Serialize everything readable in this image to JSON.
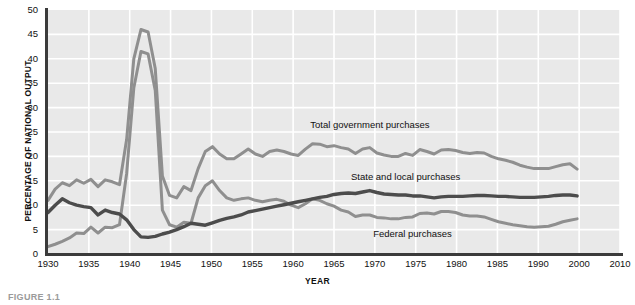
{
  "chart_data": {
    "type": "line",
    "title": "",
    "xlabel": "YEAR",
    "ylabel": "PERCENTAGE OF NATIONAL OUTPUT",
    "xlim": [
      1930,
      2010
    ],
    "ylim": [
      0,
      50
    ],
    "grid": true,
    "legend_position": "inline-annotations",
    "xticks": [
      "1930",
      "1935",
      "1940",
      "1945",
      "1950",
      "1955",
      "1960",
      "1965",
      "1970",
      "1975",
      "1980",
      "1985",
      "1990",
      "2000",
      "2010"
    ],
    "yticks": [
      "0",
      "5",
      "10",
      "15",
      "20",
      "25",
      "30",
      "35",
      "40",
      "45",
      "50"
    ],
    "x": [
      1930,
      1931,
      1932,
      1933,
      1934,
      1935,
      1936,
      1937,
      1938,
      1939,
      1940,
      1941,
      1942,
      1943,
      1944,
      1945,
      1946,
      1947,
      1948,
      1949,
      1950,
      1951,
      1952,
      1953,
      1954,
      1955,
      1956,
      1957,
      1958,
      1959,
      1960,
      1961,
      1962,
      1963,
      1964,
      1965,
      1966,
      1967,
      1968,
      1969,
      1970,
      1971,
      1972,
      1973,
      1974,
      1975,
      1976,
      1977,
      1978,
      1979,
      1980,
      1981,
      1982,
      1983,
      1984,
      1985,
      1986,
      1987,
      1988,
      1989,
      1990,
      1991,
      1992,
      1993,
      1994,
      1995,
      1996,
      1997,
      1998,
      1999,
      2000,
      2001,
      2002,
      2003,
      2004
    ],
    "series": [
      {
        "name": "Total government purchases",
        "color": "#8f8f8f",
        "values": [
          11.0,
          13.3,
          14.6,
          14.0,
          15.2,
          14.5,
          15.3,
          13.8,
          15.2,
          14.8,
          14.2,
          23.5,
          40.0,
          46.0,
          45.5,
          38.0,
          16.0,
          12.0,
          11.5,
          13.8,
          13.0,
          17.5,
          21.0,
          22.0,
          20.5,
          19.5,
          19.5,
          20.5,
          21.5,
          20.5,
          20.0,
          21.0,
          21.3,
          21.0,
          20.5,
          20.2,
          21.5,
          22.6,
          22.5,
          22.0,
          22.2,
          21.8,
          21.5,
          20.6,
          21.5,
          21.8,
          20.7,
          20.3,
          20.0,
          20.0,
          20.6,
          20.2,
          21.4,
          21.0,
          20.5,
          21.3,
          21.4,
          21.2,
          20.8,
          20.6,
          20.8,
          20.7,
          20.0,
          19.5,
          19.2,
          18.8,
          18.2,
          17.8,
          17.5,
          17.5,
          17.5,
          17.9,
          18.3,
          18.5,
          17.4
        ]
      },
      {
        "name": "Federal purchases",
        "color": "#8f8f8f",
        "values": [
          1.5,
          2.0,
          2.6,
          3.3,
          4.3,
          4.2,
          5.5,
          4.3,
          5.5,
          5.4,
          6.0,
          16.5,
          34.0,
          41.5,
          41.0,
          33.5,
          9.0,
          6.0,
          5.5,
          6.5,
          6.3,
          11.5,
          14.0,
          15.0,
          13.0,
          11.5,
          11.0,
          11.3,
          11.5,
          11.0,
          10.7,
          11.0,
          11.2,
          10.8,
          10.0,
          9.5,
          10.3,
          11.3,
          11.0,
          10.3,
          9.8,
          9.0,
          8.6,
          7.7,
          8.0,
          8.0,
          7.5,
          7.4,
          7.2,
          7.2,
          7.5,
          7.6,
          8.3,
          8.4,
          8.2,
          8.7,
          8.7,
          8.5,
          8.0,
          7.8,
          7.8,
          7.6,
          7.1,
          6.6,
          6.3,
          6.0,
          5.8,
          5.6,
          5.5,
          5.6,
          5.7,
          6.1,
          6.6,
          6.9,
          7.2
        ]
      },
      {
        "name": "State and local purchases",
        "color": "#4c4c4c",
        "values": [
          8.5,
          10.0,
          11.3,
          10.5,
          10.0,
          9.7,
          9.5,
          8.0,
          9.0,
          8.5,
          8.2,
          7.0,
          5.0,
          3.5,
          3.4,
          3.6,
          4.1,
          4.5,
          5.0,
          5.6,
          6.3,
          6.1,
          5.9,
          6.4,
          6.9,
          7.3,
          7.6,
          8.0,
          8.6,
          8.9,
          9.2,
          9.5,
          9.8,
          10.1,
          10.4,
          10.7,
          11.0,
          11.3,
          11.6,
          11.8,
          12.2,
          12.4,
          12.5,
          12.4,
          12.7,
          13.0,
          12.6,
          12.3,
          12.2,
          12.1,
          12.1,
          11.9,
          11.9,
          11.7,
          11.5,
          11.7,
          11.8,
          11.8,
          11.8,
          11.9,
          12.0,
          12.0,
          11.9,
          11.8,
          11.8,
          11.7,
          11.6,
          11.6,
          11.6,
          11.7,
          11.8,
          12.0,
          12.1,
          12.1,
          11.9
        ]
      }
    ],
    "annotations": [
      {
        "text": "Total government purchases",
        "x": 1975,
        "y": 26.5
      },
      {
        "text": "State and local purchases",
        "x": 1980,
        "y": 15.8
      },
      {
        "text": "Federal purchases",
        "x": 1981,
        "y": 4.0
      }
    ]
  },
  "caption": {
    "text": "FIGURE 1.1"
  }
}
